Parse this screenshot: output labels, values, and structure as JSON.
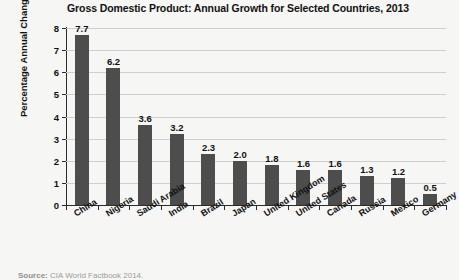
{
  "chart_data": {
    "type": "bar",
    "title": "Gross Domestic Product: Annual Growth for Selected Countries, 2013",
    "xlabel": "",
    "ylabel": "Percentage Annual Change",
    "categories": [
      "China",
      "Nigeria",
      "Saudi Arabia",
      "India",
      "Brazil",
      "Japan",
      "United Kingdom",
      "United States",
      "Canada",
      "Russia",
      "Mexico",
      "Germany"
    ],
    "values": [
      7.7,
      6.2,
      3.6,
      3.2,
      2.3,
      2.0,
      1.8,
      1.6,
      1.6,
      1.3,
      1.2,
      0.5
    ],
    "value_labels": [
      "7.7",
      "6.2",
      "3.6",
      "3.2",
      "2.3",
      "2.0",
      "1.8",
      "1.6",
      "1.6",
      "1.3",
      "1.2",
      "0.5"
    ],
    "ylim": [
      0,
      8
    ],
    "ytick_labels": [
      "0",
      "1",
      "2",
      "3",
      "4",
      "5",
      "6",
      "7",
      "8"
    ],
    "ytick_values": [
      0,
      1,
      2,
      3,
      4,
      5,
      6,
      7,
      8
    ],
    "grid": true,
    "legend": false,
    "bar_color": "#4d4d4d",
    "grid_color": "#cfcfcb",
    "axis_color": "#2b2b2b",
    "background_color": "#f6f6f4"
  },
  "source": {
    "label": "Source:",
    "text": "CIA World Factbook 2014."
  }
}
